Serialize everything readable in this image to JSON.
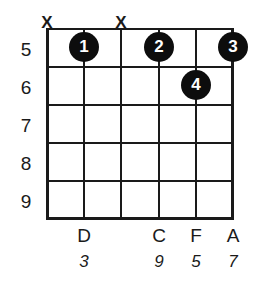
{
  "diagram": {
    "type": "guitar-chord-diagram",
    "start_fret": 5,
    "string_count": 6,
    "fret_count": 5,
    "colors": {
      "line": "#1a1a1a",
      "dot_fill": "#0d0d0d",
      "dot_text": "#ffffff",
      "background": "#ffffff"
    },
    "fret_numbers": [
      "5",
      "6",
      "7",
      "8",
      "9"
    ],
    "strings": [
      {
        "index": 1,
        "marker": "X",
        "note": "",
        "interval": ""
      },
      {
        "index": 2,
        "marker": "",
        "note": "D",
        "interval": "3"
      },
      {
        "index": 3,
        "marker": "X",
        "note": "",
        "interval": ""
      },
      {
        "index": 4,
        "marker": "",
        "note": "C",
        "interval": "9"
      },
      {
        "index": 5,
        "marker": "",
        "note": "F",
        "interval": "5"
      },
      {
        "index": 6,
        "marker": "",
        "note": "A",
        "interval": "7"
      }
    ],
    "dots": [
      {
        "finger": "1",
        "string": 2,
        "fret": 5
      },
      {
        "finger": "2",
        "string": 4,
        "fret": 5
      },
      {
        "finger": "3",
        "string": 6,
        "fret": 5
      },
      {
        "finger": "4",
        "string": 5,
        "fret": 6
      }
    ]
  }
}
